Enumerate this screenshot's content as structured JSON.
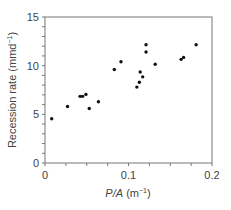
{
  "chart_data": {
    "type": "scatter",
    "title": "",
    "xlabel": "P/A (m⁻¹)",
    "xlabel_parts": {
      "italic": "P/A",
      "unit": " (m",
      "sup": "−1",
      "close": ")"
    },
    "ylabel": "Recession rate (mmd⁻¹)",
    "ylabel_parts": {
      "main": "Recession rate (mmd",
      "sup": "−1",
      "close": ")"
    },
    "xlim": [
      0,
      0.2
    ],
    "ylim": [
      0,
      15
    ],
    "x_ticks": [
      0,
      0.1,
      0.2
    ],
    "x_tick_labels": [
      "0",
      "0.1",
      "0.2"
    ],
    "x_minor_step": 0.025,
    "y_ticks": [
      0,
      5,
      10,
      15
    ],
    "y_tick_labels": [
      "0",
      "5",
      "10",
      "15"
    ],
    "y_minor_step": 1,
    "grid": false,
    "legend": null,
    "marker_color": "#111111",
    "points": [
      {
        "x": 0.008,
        "y": 4.55
      },
      {
        "x": 0.027,
        "y": 5.8
      },
      {
        "x": 0.042,
        "y": 6.85
      },
      {
        "x": 0.045,
        "y": 6.85
      },
      {
        "x": 0.049,
        "y": 7.05
      },
      {
        "x": 0.053,
        "y": 5.6
      },
      {
        "x": 0.064,
        "y": 6.3
      },
      {
        "x": 0.083,
        "y": 9.6
      },
      {
        "x": 0.091,
        "y": 10.4
      },
      {
        "x": 0.11,
        "y": 7.8
      },
      {
        "x": 0.113,
        "y": 8.3
      },
      {
        "x": 0.114,
        "y": 9.35
      },
      {
        "x": 0.117,
        "y": 8.85
      },
      {
        "x": 0.121,
        "y": 11.4
      },
      {
        "x": 0.121,
        "y": 12.15
      },
      {
        "x": 0.132,
        "y": 10.15
      },
      {
        "x": 0.163,
        "y": 10.65
      },
      {
        "x": 0.166,
        "y": 10.85
      },
      {
        "x": 0.181,
        "y": 12.15
      }
    ]
  }
}
